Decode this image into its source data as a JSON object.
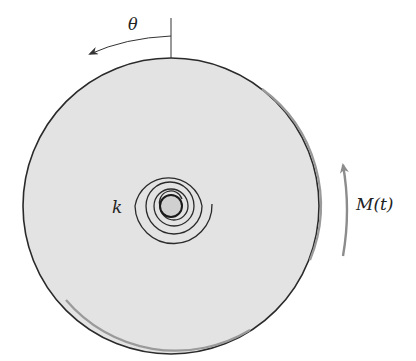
{
  "diagram": {
    "type": "torsional-spring-disk",
    "labels": {
      "angle": "θ",
      "spring_constant": "k",
      "moment": "M(t)"
    },
    "colors": {
      "disk_fill": "#e3e3e3",
      "disk_outline": "#2a2a2a",
      "rim_highlight": "#9a9a9a",
      "moment_arrow": "#8c8c8c",
      "angle_arrow": "#333333",
      "spring": "#2a2a2a"
    }
  }
}
